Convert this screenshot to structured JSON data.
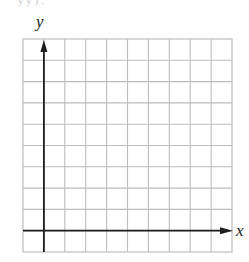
{
  "diagram": {
    "type": "coordinate-grid",
    "grid": {
      "columns": 10,
      "rows": 10,
      "left": 23,
      "top": 39,
      "cell_width": 20.9,
      "cell_height": 21.3,
      "line_color": "#bdbdbd"
    },
    "axes": {
      "x_label": "x",
      "y_label": "y",
      "y_axis_column_index": 1,
      "x_axis_row_index": 9,
      "axis_color": "#1e1e1e"
    },
    "top_cropped_text": "y y ) ."
  }
}
